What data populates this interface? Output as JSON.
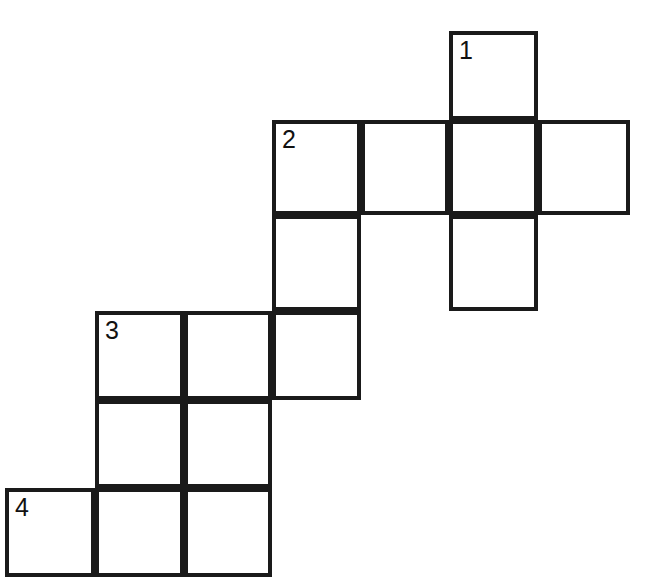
{
  "puzzle": {
    "type": "crossword-grid",
    "title": "Crossword Grid",
    "background_color": "#ffffff",
    "line_color": "#1a1a1a",
    "line_width_px": 4,
    "canvas": {
      "width": 647,
      "height": 588
    },
    "cell_size_px": 89,
    "column_edges_px": [
      5,
      95,
      184,
      272,
      361,
      449,
      538,
      630
    ],
    "row_edges_px": [
      31,
      120,
      215,
      311,
      400,
      488,
      577
    ],
    "clue_numbers_visible": [
      "1",
      "2",
      "3",
      "4"
    ],
    "cells": [
      {
        "name": "cell-r0c5",
        "row": 0,
        "col": 5,
        "x": 449,
        "y": 31,
        "w": 89,
        "h": 89,
        "number": "1"
      },
      {
        "name": "cell-r1c3",
        "row": 1,
        "col": 3,
        "x": 272,
        "y": 120,
        "w": 89,
        "h": 95,
        "number": "2"
      },
      {
        "name": "cell-r1c4",
        "row": 1,
        "col": 4,
        "x": 361,
        "y": 120,
        "w": 88,
        "h": 95,
        "number": ""
      },
      {
        "name": "cell-r1c5",
        "row": 1,
        "col": 5,
        "x": 449,
        "y": 120,
        "w": 89,
        "h": 95,
        "number": ""
      },
      {
        "name": "cell-r1c6",
        "row": 1,
        "col": 6,
        "x": 538,
        "y": 120,
        "w": 92,
        "h": 95,
        "number": ""
      },
      {
        "name": "cell-r2c3",
        "row": 2,
        "col": 3,
        "x": 272,
        "y": 215,
        "w": 89,
        "h": 96,
        "number": ""
      },
      {
        "name": "cell-r2c5",
        "row": 2,
        "col": 5,
        "x": 449,
        "y": 215,
        "w": 89,
        "h": 96,
        "number": ""
      },
      {
        "name": "cell-r3c1",
        "row": 3,
        "col": 1,
        "x": 95,
        "y": 311,
        "w": 89,
        "h": 89,
        "number": "3"
      },
      {
        "name": "cell-r3c2",
        "row": 3,
        "col": 2,
        "x": 184,
        "y": 311,
        "w": 88,
        "h": 89,
        "number": ""
      },
      {
        "name": "cell-r3c3",
        "row": 3,
        "col": 3,
        "x": 272,
        "y": 311,
        "w": 89,
        "h": 89,
        "number": ""
      },
      {
        "name": "cell-r4c1",
        "row": 4,
        "col": 1,
        "x": 95,
        "y": 400,
        "w": 89,
        "h": 88,
        "number": ""
      },
      {
        "name": "cell-r4c2",
        "row": 4,
        "col": 2,
        "x": 184,
        "y": 400,
        "w": 88,
        "h": 88,
        "number": ""
      },
      {
        "name": "cell-r5c0",
        "row": 5,
        "col": 0,
        "x": 5,
        "y": 488,
        "w": 90,
        "h": 89,
        "number": "4"
      },
      {
        "name": "cell-r5c1",
        "row": 5,
        "col": 1,
        "x": 95,
        "y": 488,
        "w": 89,
        "h": 89,
        "number": ""
      },
      {
        "name": "cell-r5c2",
        "row": 5,
        "col": 2,
        "x": 184,
        "y": 488,
        "w": 88,
        "h": 89,
        "number": ""
      }
    ]
  }
}
